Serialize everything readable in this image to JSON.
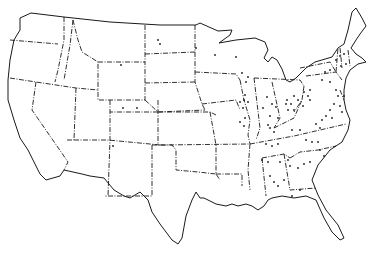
{
  "map": {
    "title": "United States outline map with point locations",
    "colors": {
      "line": "#1a1a1a",
      "background": "#ffffff",
      "dot": "#1a1a1a"
    },
    "outline_path": "M31,13 L64,17 L110,22 L160,25 L196,25 L200,23 L218,31 L232,30 L230,35 L219,43 L236,40 L255,38 L265,42 L268,50 L264,58 L268,62 L272,57 L277,60 L282,69 L286,80 L290,82 L296,78 L306,68 L315,62 L332,57 L338,48 L344,44 L348,30 L352,12 L356,8 L362,18 L366,26 L360,34 L356,40 L351,48 L356,54 L362,58 L366,62 L358,64 L350,70 L346,78 L344,90 L344,100 L346,110 L350,120 L348,130 L342,142 L330,150 L318,165 L312,180 L318,195 L326,210 L338,225 L344,238 L340,240 L332,232 L324,218 L316,200 L306,196 L294,198 L282,196 L272,198 L268,200 L264,206 L258,210 L252,206 L246,204 L238,206 L232,204 L226,206 L216,204 L204,198 L200,198 L196,192 L192,200 L186,216 L182,238 L178,244 L172,240 L160,224 L152,212 L148,200 L140,192 L130,198 L124,196 L114,190 L104,178 L90,176 L82,174 L64,170 L60,176 L46,180 L40,174 L36,166 L28,150 L20,138 L14,120 L8,100 L8,80 L10,60 L14,40 L20,30 L20,18 L31,13 Z",
    "border_paths": [
      "M64,17 L64,40 L58,70 L55,82",
      "M10,40 L58,44",
      "M10,78 L36,82 L76,88 L98,90",
      "M36,82 L32,110 L68,162 L64,170",
      "M76,88 L74,140 L66,140",
      "M73,20 L70,45 L64,80",
      "M73,20 L78,40 L82,52 L98,62 L98,90",
      "M98,62 L145,62 L145,100 L98,100 L98,90",
      "M145,25 L145,62",
      "M145,54 L195,52",
      "M145,83 L195,82",
      "M110,100 L110,140 L108,196",
      "M74,140 L108,140 L150,144 L160,145",
      "M158,112 L110,112",
      "M158,100 L158,145",
      "M145,100 L158,112 L205,110",
      "M152,145 L152,196 L108,196 L104,196",
      "M152,145 L172,145 L176,150 L176,170 L198,172 L216,174",
      "M158,112 L210,112 L216,115",
      "M195,25 L195,52 L195,82 L202,104 L205,110",
      "M210,112 L216,145 L216,174 L220,180",
      "M160,145 L250,144",
      "M216,174 L242,174 L242,186",
      "M202,104 L236,100 L240,110",
      "M195,72 L236,74 L240,80",
      "M240,80 L244,100 L250,120 L248,135 L250,144",
      "M254,78 L260,128 L256,140",
      "M272,82 L280,118 L274,128",
      "M254,78 L300,80 L304,86",
      "M304,86 L302,100 L294,112",
      "M274,128 L294,118 L302,100",
      "M250,144 L248,170 L250,190",
      "M250,144 L294,136 L320,130 L346,124",
      "M262,158 L266,196",
      "M262,158 L284,154 L290,158",
      "M284,154 L290,190 L316,188",
      "M290,158 L300,152 L318,150 L336,146",
      "M300,68 L330,62 L336,72",
      "M306,76 L336,72 L342,80",
      "M336,72 L338,48",
      "M340,48 L342,68",
      "M348,50 L350,66",
      "M340,90 L344,100"
    ],
    "dots": [
      [
        158,
        40
      ],
      [
        160,
        44
      ],
      [
        121,
        65
      ],
      [
        123,
        108
      ],
      [
        137,
        108
      ],
      [
        113,
        146
      ],
      [
        196,
        48
      ],
      [
        215,
        55
      ],
      [
        236,
        57
      ],
      [
        242,
        73
      ],
      [
        248,
        77
      ],
      [
        246,
        82
      ],
      [
        245,
        95
      ],
      [
        244,
        100
      ],
      [
        240,
        102
      ],
      [
        248,
        102
      ],
      [
        243,
        108
      ],
      [
        245,
        118
      ],
      [
        240,
        122
      ],
      [
        244,
        126
      ],
      [
        267,
        97
      ],
      [
        272,
        104
      ],
      [
        278,
        118
      ],
      [
        276,
        107
      ],
      [
        263,
        108
      ],
      [
        270,
        116
      ],
      [
        268,
        125
      ],
      [
        287,
        100
      ],
      [
        291,
        104
      ],
      [
        294,
        96
      ],
      [
        298,
        100
      ],
      [
        294,
        110
      ],
      [
        288,
        110
      ],
      [
        286,
        104
      ],
      [
        304,
        92
      ],
      [
        308,
        96
      ],
      [
        310,
        90
      ],
      [
        310,
        100
      ],
      [
        303,
        106
      ],
      [
        322,
        80
      ],
      [
        330,
        82
      ],
      [
        336,
        90
      ],
      [
        338,
        96
      ],
      [
        334,
        104
      ],
      [
        330,
        110
      ],
      [
        326,
        116
      ],
      [
        332,
        118
      ],
      [
        322,
        120
      ],
      [
        316,
        124
      ],
      [
        320,
        128
      ],
      [
        325,
        72
      ],
      [
        330,
        70
      ],
      [
        336,
        60
      ],
      [
        340,
        56
      ],
      [
        344,
        54
      ],
      [
        346,
        64
      ],
      [
        341,
        66
      ],
      [
        270,
        128
      ],
      [
        274,
        132
      ],
      [
        266,
        144
      ],
      [
        272,
        146
      ],
      [
        278,
        144
      ],
      [
        292,
        130
      ],
      [
        300,
        130
      ],
      [
        306,
        140
      ],
      [
        312,
        142
      ],
      [
        318,
        142
      ],
      [
        320,
        150
      ],
      [
        324,
        156
      ],
      [
        262,
        160
      ],
      [
        268,
        162
      ],
      [
        280,
        162
      ],
      [
        288,
        160
      ],
      [
        290,
        166
      ],
      [
        298,
        168
      ],
      [
        304,
        164
      ],
      [
        310,
        162
      ],
      [
        270,
        176
      ],
      [
        274,
        182
      ],
      [
        278,
        186
      ],
      [
        284,
        180
      ],
      [
        292,
        196
      ],
      [
        300,
        190
      ],
      [
        340,
        106
      ],
      [
        342,
        112
      ],
      [
        344,
        96
      ]
    ]
  }
}
